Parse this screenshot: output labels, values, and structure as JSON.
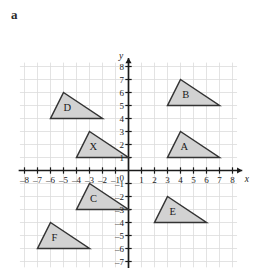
{
  "figure": {
    "label": "a",
    "axis_x_name": "x",
    "axis_y_name": "y",
    "origin_label": "0"
  },
  "colors": {
    "grid": "#dcdcdc",
    "axis": "#1a1a1a",
    "shape_fill": "#d2d2d2",
    "shape_stroke": "#333333",
    "background": "#ffffff"
  },
  "chart_data": {
    "type": "scatter",
    "title": "",
    "xlabel": "x",
    "ylabel": "y",
    "xlim": [
      -8,
      8
    ],
    "ylim": [
      -7,
      8
    ],
    "grid": true,
    "legend": "none",
    "x_ticks": [
      -8,
      -7,
      -6,
      -5,
      -4,
      -3,
      -2,
      -1,
      1,
      2,
      3,
      4,
      5,
      6,
      7,
      8
    ],
    "y_ticks": [
      8,
      7,
      6,
      5,
      4,
      3,
      2,
      1,
      -1,
      -2,
      -3,
      -4,
      -5,
      -6,
      -7
    ],
    "x_tick_labels": [
      "-8",
      "-7",
      "-6",
      "-5",
      "-4",
      "-3",
      "-2",
      "-1",
      "1",
      "2",
      "3",
      "4",
      "5",
      "6",
      "7",
      "8"
    ],
    "y_tick_labels": [
      "8",
      "7",
      "6",
      "5",
      "4",
      "3",
      "2",
      "1",
      "-1",
      "-2",
      "-3",
      "-4",
      "-5",
      "-6",
      "-7"
    ],
    "shapes": [
      {
        "name": "A",
        "label": "A",
        "vertices": [
          [
            3,
            1
          ],
          [
            7,
            1
          ],
          [
            4,
            3
          ]
        ],
        "label_pos": [
          4.3,
          1.75
        ]
      },
      {
        "name": "B",
        "label": "B",
        "vertices": [
          [
            3,
            5
          ],
          [
            7,
            5
          ],
          [
            4,
            7
          ]
        ],
        "label_pos": [
          4.4,
          5.8
        ]
      },
      {
        "name": "C",
        "label": "C",
        "vertices": [
          [
            -4,
            -3
          ],
          [
            0,
            -3
          ],
          [
            -3,
            -1
          ]
        ],
        "label_pos": [
          -2.7,
          -2.2
        ]
      },
      {
        "name": "D",
        "label": "D",
        "vertices": [
          [
            -6,
            4
          ],
          [
            -2,
            4
          ],
          [
            -5,
            6
          ]
        ],
        "label_pos": [
          -4.7,
          4.8
        ]
      },
      {
        "name": "E",
        "label": "E",
        "vertices": [
          [
            2,
            -4
          ],
          [
            6,
            -4
          ],
          [
            3,
            -2
          ]
        ],
        "label_pos": [
          3.4,
          -3.2
        ]
      },
      {
        "name": "F",
        "label": "F",
        "vertices": [
          [
            -7,
            -6
          ],
          [
            -3,
            -6
          ],
          [
            -6,
            -4
          ]
        ],
        "label_pos": [
          -5.7,
          -5.2
        ]
      },
      {
        "name": "X",
        "label": "X",
        "vertices": [
          [
            -4,
            1
          ],
          [
            0,
            1
          ],
          [
            -3,
            3
          ]
        ],
        "label_pos": [
          -2.7,
          1.8
        ]
      }
    ]
  }
}
